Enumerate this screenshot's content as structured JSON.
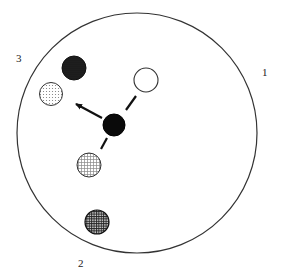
{
  "labels": {
    "region_1": "1",
    "region_2": "2",
    "region_3": "3"
  },
  "nodes": [
    {
      "id": "center",
      "fill": "solid-black"
    },
    {
      "id": "open",
      "fill": "white"
    },
    {
      "id": "dark-dotted",
      "fill": "dense-dots"
    },
    {
      "id": "light-dotted",
      "fill": "light-dots"
    },
    {
      "id": "light-grid",
      "fill": "light-crosshatch"
    },
    {
      "id": "dark-grid",
      "fill": "dense-crosshatch"
    }
  ],
  "colors": {
    "stroke": "#333333",
    "black": "#0a0a0a",
    "dark_dots": "#1a1a1a"
  }
}
